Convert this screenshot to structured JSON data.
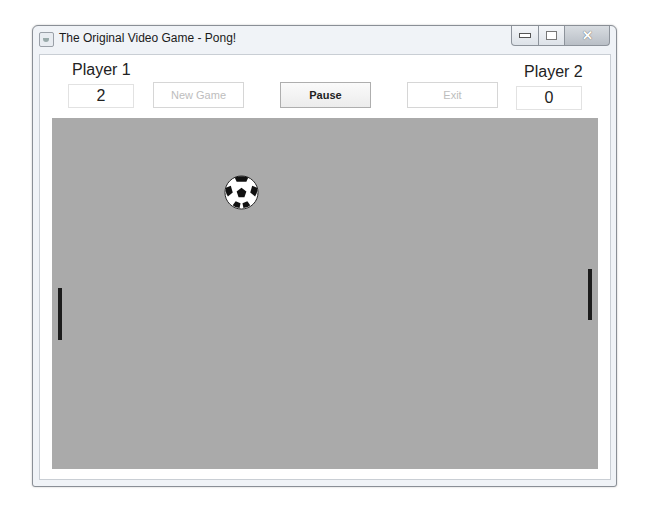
{
  "window": {
    "title": "The Original Video Game - Pong!",
    "controls": [
      "minimize",
      "maximize",
      "close"
    ]
  },
  "scoreboard": {
    "player1": {
      "label": "Player 1",
      "score": "2"
    },
    "player2": {
      "label": "Player 2",
      "score": "0"
    }
  },
  "toolbar": {
    "new_game_label": "New Game",
    "new_game_enabled": false,
    "pause_label": "Pause",
    "pause_enabled": true,
    "exit_label": "Exit",
    "exit_enabled": false
  },
  "court": {
    "background": "#aaaaaa",
    "ball": {
      "icon": "soccer-ball-icon",
      "x": 241,
      "y": 191
    },
    "left_paddle": {
      "x": 57,
      "y_top": 287,
      "y_bottom": 339,
      "color": "#1c1c1c"
    },
    "right_paddle": {
      "x": 587,
      "y_top": 268,
      "y_bottom": 319,
      "color": "#1c1c1c"
    }
  }
}
